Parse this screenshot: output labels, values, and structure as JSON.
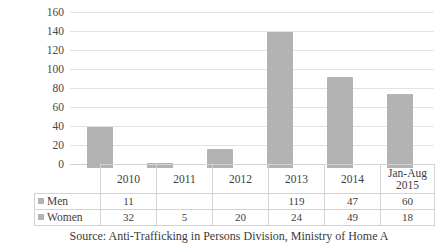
{
  "chart_data": {
    "type": "bar",
    "title": "",
    "xlabel": "",
    "ylabel": "",
    "categories": [
      "2010",
      "2011",
      "2012",
      "2013",
      "2014",
      "Jan-Aug 2015"
    ],
    "values": [
      43,
      5,
      20,
      143,
      96,
      78
    ],
    "series": [
      {
        "name": "Men",
        "values": [
          "11",
          "",
          "",
          "119",
          "47",
          "60"
        ]
      },
      {
        "name": "Women",
        "values": [
          "32",
          "5",
          "20",
          "24",
          "49",
          "18"
        ]
      }
    ],
    "ylim": [
      0,
      160
    ],
    "yticks": [
      "0",
      "20",
      "40",
      "60",
      "80",
      "100",
      "120",
      "140",
      "160"
    ],
    "grid": true,
    "legend_position": "data-table",
    "bar_color": "#b3b3b3",
    "gridline_color": "#e2e2e2",
    "note": "Bars show the combined total of the Men and Women rows for each period."
  },
  "table": {
    "corner_label": "",
    "category_headers": [
      {
        "line1": "2010",
        "line2": ""
      },
      {
        "line1": "2011",
        "line2": ""
      },
      {
        "line1": "2012",
        "line2": ""
      },
      {
        "line1": "2013",
        "line2": ""
      },
      {
        "line1": "2014",
        "line2": ""
      },
      {
        "line1": "Jan-Aug",
        "line2": "2015"
      }
    ],
    "rows": [
      {
        "name": "Men",
        "cells": [
          "11",
          "",
          "",
          "119",
          "47",
          "60"
        ]
      },
      {
        "name": "Women",
        "cells": [
          "32",
          "5",
          "20",
          "24",
          "49",
          "18"
        ]
      }
    ]
  },
  "caption": {
    "text": "Source: Anti-Trafficking in Persons Division, Ministry of Home A"
  }
}
